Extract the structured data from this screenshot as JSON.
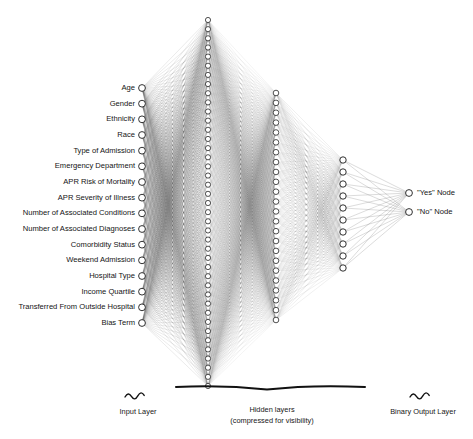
{
  "figure": {
    "background_color": "#ffffff",
    "node_fill": "#ffffff",
    "node_stroke": "#1a1a1a",
    "edge_color": "#555555"
  },
  "input_layer": {
    "caption": "Input Layer",
    "node_count": 15,
    "labels": [
      "Age",
      "Gender",
      "Ethnicity",
      "Race",
      "Type of Admission",
      "Emergency Department",
      "APR Risk of Mortality",
      "APR Severity of Illness",
      "Number of Associated Conditions",
      "Number of Associated Diagnoses",
      "Comorbidity Status",
      "Weekend Admission",
      "Hospital Type",
      "Income Quartile",
      "Transferred From Outside Hospital",
      "Bias Term"
    ]
  },
  "hidden_layers": {
    "caption_line1": "Hidden layers",
    "caption_line2": "(compressed for visibility)",
    "layers": [
      {
        "name": "hidden-layer-1",
        "node_count": 41
      },
      {
        "name": "hidden-layer-2",
        "node_count": 24
      },
      {
        "name": "hidden-layer-3",
        "node_count": 10
      }
    ]
  },
  "output_layer": {
    "caption": "Binary Output Layer",
    "node_count": 2,
    "labels": [
      "\"Yes\" Node",
      "\"No\" Node"
    ]
  }
}
